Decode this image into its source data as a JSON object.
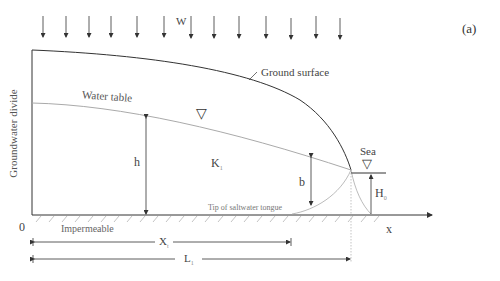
{
  "figure": {
    "panel_label": "(a)",
    "recharge_label": "W",
    "recharge_arrow_count": 17,
    "labels": {
      "ground_surface": "Ground surface",
      "water_table": "Water table",
      "groundwater_divide": "Groundwater divide",
      "head": "h",
      "conductivity": "K",
      "conductivity_sub": "1",
      "interface_depth": "b",
      "sea": "Sea",
      "sea_head": "H",
      "sea_head_sub": "0",
      "tip_label": "Tip of saltwater tongue",
      "impermeable": "Impermeable",
      "origin": "0",
      "x_axis": "x",
      "tip_distance": "X",
      "tip_distance_sub": "t",
      "aquifer_length": "L",
      "aquifer_length_sub": "1"
    },
    "symbols": {
      "water_table_marker": "▽",
      "sea_marker": "▽"
    },
    "colors": {
      "line_dark": "#333333",
      "line_light": "#aaaaaa",
      "text": "#444444"
    }
  }
}
